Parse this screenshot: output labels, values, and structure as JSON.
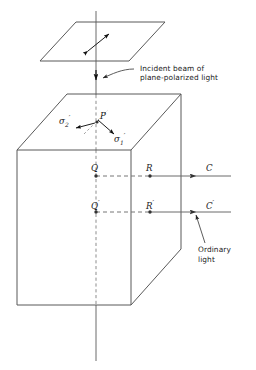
{
  "figure": {
    "type": "optics-ray-diagram",
    "stroke_color": "#555555",
    "text_color": "#1a1a1a",
    "background": "#ffffff",
    "width": 256,
    "height": 370
  },
  "annotations": {
    "incident_beam_line1": "Incident beam of",
    "incident_beam_line2": "plane-polarized light",
    "ordinary_light_line1": "Ordinary",
    "ordinary_light_line2": "light"
  },
  "points": {
    "P": "P",
    "Q": "Q",
    "R": "R",
    "C": "C",
    "Q_prime": "Q",
    "R_prime": "R",
    "C_prime": "C",
    "prime_mark": "′"
  },
  "vectors": {
    "sigma1_symbol": "σ",
    "sigma1_sub": "1",
    "sigma1_prime": "′",
    "sigma2_symbol": "σ",
    "sigma2_sub": "2",
    "sigma2_prime": "′"
  },
  "elements": {
    "polarizer_plate": "polarizer-plate",
    "crystal_block": "calcite-crystal-block",
    "optic_axis": "vertical-axis-line",
    "ray_upper": "ray-Q-R-C",
    "ray_lower": "ray-Qprime-Rprime-Cprime",
    "polarization_arrow": "double-headed-polarization-arrow"
  }
}
